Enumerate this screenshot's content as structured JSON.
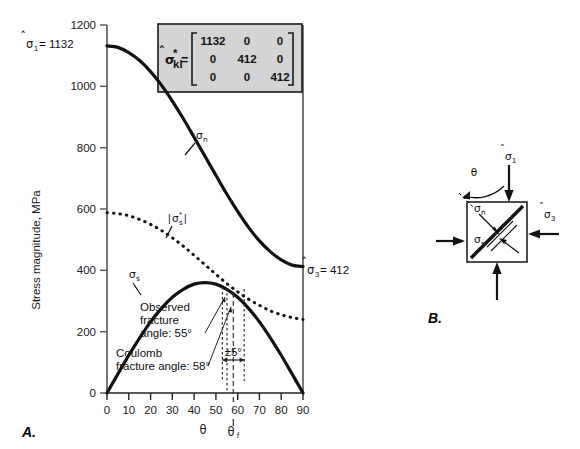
{
  "figure": {
    "panel_a_label": "A.",
    "panel_b_label": "B."
  },
  "chart_data": {
    "type": "line",
    "title": "",
    "xlabel": "θ",
    "ylabel": "Stress magnitude, MPa",
    "xlim": [
      0,
      90
    ],
    "ylim": [
      0,
      1200
    ],
    "xticks": [
      0,
      10,
      20,
      30,
      40,
      50,
      60,
      70,
      80,
      90
    ],
    "yticks": [
      0,
      200,
      400,
      600,
      800,
      1000,
      1200
    ],
    "grid": false,
    "legend_position": "inline-labels",
    "x": [
      0,
      5,
      10,
      15,
      20,
      25,
      30,
      35,
      40,
      45,
      50,
      55,
      60,
      65,
      70,
      75,
      80,
      85,
      90
    ],
    "series": [
      {
        "name": "σn",
        "label": "σ",
        "label_sub": "n",
        "style": "solid-thick",
        "values": [
          1132,
          1127,
          1110,
          1084,
          1048,
          1004,
          952,
          895,
          834,
          772,
          710,
          649,
          592,
          540,
          496,
          461,
          434,
          417,
          412
        ]
      },
      {
        "name": "σs",
        "label": "σ",
        "label_sub": "s",
        "style": "solid-thick",
        "values": [
          0,
          62,
          123,
          180,
          232,
          276,
          312,
          338,
          355,
          360,
          355,
          338,
          312,
          276,
          232,
          180,
          123,
          62,
          0
        ]
      },
      {
        "name": "|σ*s|",
        "label": "|σ*s|",
        "style": "dotted-thick",
        "values": [
          588,
          585,
          578,
          566,
          550,
          530,
          506,
          479,
          449,
          418,
          387,
          357,
          330,
          306,
          286,
          268,
          255,
          246,
          240
        ]
      }
    ],
    "annotations": [
      {
        "name": "sigma1-axis-value",
        "text": "σ̂1 = 1132",
        "value": 1132,
        "at_theta": 0
      },
      {
        "name": "sigma3-axis-value",
        "text": "σ̂3 = 412",
        "value": 412,
        "at_theta": 90
      },
      {
        "name": "observed-fracture-angle",
        "text": "Observed fracture angle: 55°",
        "value": 55
      },
      {
        "name": "coulomb-fracture-angle",
        "text": "Coulomb fracture angle: 58°",
        "value": 58
      },
      {
        "name": "tolerance-bracket",
        "text": "±5°",
        "range": [
          53,
          63
        ]
      },
      {
        "name": "theta-f-marker",
        "text": "θf",
        "value": 58
      }
    ]
  },
  "axis": {
    "y_title": "Stress magnitude, MPa",
    "x_title": "θ",
    "x_secondary_title": "θ",
    "x_secondary_sub": "f",
    "yticks": [
      "0",
      "200",
      "400",
      "600",
      "800",
      "1000",
      "1200"
    ],
    "xticks": [
      "0",
      "10",
      "20",
      "30",
      "40",
      "50",
      "60",
      "70",
      "80",
      "90"
    ]
  },
  "sigma1_label": {
    "symbol": "σ",
    "hat": "̂",
    "sub": "1",
    "equals": "= 1132",
    "value": "1132"
  },
  "sigma3_label": {
    "symbol": "σ",
    "sub": "3",
    "equals": "= 412",
    "value": "412"
  },
  "matrix_inset": {
    "lhs_symbol": "σ",
    "lhs_sub": "kl",
    "lhs_star": "*",
    "lhs_equals": "=",
    "rows": [
      [
        "1132",
        "0",
        "0"
      ],
      [
        "0",
        "412",
        "0"
      ],
      [
        "0",
        "0",
        "412"
      ]
    ],
    "background_color": "#d4d4d4",
    "border_color": "#1a1a1a"
  },
  "curve_labels": {
    "sigma_n": "σ",
    "sigma_n_sub": "n",
    "sigma_s": "σ",
    "sigma_s_sub": "s",
    "sigma_s_star_open": "|",
    "sigma_s_star": "σ",
    "sigma_s_star_sub": "s",
    "sigma_s_star_sup": "*",
    "sigma_s_star_close": "|"
  },
  "annotations": {
    "observed_line1": "Observed",
    "observed_line2": "fracture",
    "observed_line3": "angle: 55°",
    "coulomb_line1": "Coulomb",
    "coulomb_line2": "fracture angle: 58°",
    "tolerance": "±5°"
  },
  "panel_b": {
    "label": "B.",
    "theta_label": "θ",
    "sigma1": "σ",
    "sigma1_sub": "1",
    "sigma3": "σ",
    "sigma3_sub": "3",
    "sigma_n": "σ",
    "sigma_n_sub": "n",
    "sigma_s": "σ",
    "sigma_s_sub": "s"
  }
}
